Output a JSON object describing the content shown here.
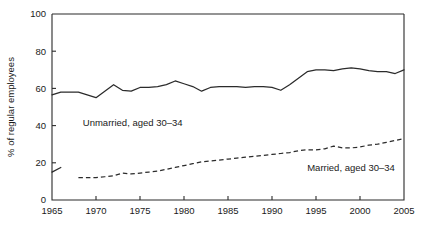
{
  "chart_data": {
    "type": "line",
    "title": "",
    "xlabel": "",
    "ylabel": "% of regular employees",
    "xlim": [
      1965,
      2005
    ],
    "ylim": [
      0,
      100
    ],
    "grid": false,
    "legend_position": "inline-annotations",
    "xticks": [
      1965,
      1970,
      1975,
      1980,
      1985,
      1990,
      1995,
      2000,
      2005
    ],
    "yticks": [
      0,
      20,
      40,
      60,
      80,
      100
    ],
    "series": [
      {
        "name": "Unmarried, aged 30-34",
        "style": "solid",
        "label_text": "Unmarried, aged 30–34",
        "x": [
          1965,
          1966,
          1968,
          1969,
          1970,
          1971,
          1972,
          1973,
          1974,
          1975,
          1976,
          1977,
          1978,
          1979,
          1980,
          1981,
          1982,
          1983,
          1984,
          1985,
          1986,
          1987,
          1988,
          1989,
          1990,
          1991,
          1992,
          1993,
          1994,
          1995,
          1996,
          1997,
          1998,
          1999,
          2000,
          2001,
          2002,
          2003,
          2004,
          2005
        ],
        "y": [
          56.5,
          58.0,
          58.0,
          56.5,
          55.0,
          58.5,
          62.0,
          59.0,
          58.5,
          60.5,
          60.5,
          61.0,
          62.0,
          64.0,
          62.5,
          61.0,
          58.5,
          60.5,
          61.0,
          61.0,
          61.0,
          60.5,
          61.0,
          61.0,
          60.5,
          59.0,
          62.0,
          65.5,
          69.0,
          70.0,
          70.0,
          69.5,
          70.5,
          71.0,
          70.5,
          69.5,
          69.0,
          69.0,
          68.0,
          70.0
        ]
      },
      {
        "name": "Married, aged 30-34",
        "style": "dashed",
        "label_text": "Married, aged 30–34",
        "x": [
          1968,
          1969,
          1970,
          1971,
          1972,
          1973,
          1974,
          1975,
          1976,
          1977,
          1978,
          1979,
          1980,
          1981,
          1982,
          1983,
          1984,
          1985,
          1986,
          1987,
          1988,
          1989,
          1990,
          1991,
          1992,
          1993,
          1994,
          1995,
          1996,
          1997,
          1998,
          1999,
          2000,
          2001,
          2002,
          2003,
          2004,
          2005
        ],
        "y": [
          12.0,
          12.0,
          12.0,
          12.5,
          13.0,
          14.5,
          14.0,
          14.5,
          15.0,
          15.5,
          16.5,
          17.5,
          18.5,
          19.5,
          20.5,
          21.0,
          21.5,
          22.0,
          22.5,
          23.0,
          23.5,
          24.0,
          24.5,
          25.0,
          25.5,
          26.5,
          27.0,
          27.0,
          27.5,
          29.0,
          28.0,
          28.0,
          28.5,
          29.5,
          30.0,
          31.0,
          32.0,
          33.0
        ]
      },
      {
        "name": "Unmarried early stub",
        "style": "solid",
        "label_text": "",
        "x": [
          1965,
          1966
        ],
        "y": [
          15.0,
          17.5
        ]
      }
    ]
  },
  "annotations": [
    {
      "id": "unmarried",
      "text": "Unmarried, aged 30–34",
      "x": 1968.5,
      "y": 40
    },
    {
      "id": "married",
      "text": "Married, aged 30–34",
      "x": 1994.0,
      "y": 15.5
    }
  ],
  "colors": {
    "line": "#2b2b2b",
    "axis": "#2b2b2b",
    "text": "#1a1a1a",
    "background": "#ffffff"
  }
}
